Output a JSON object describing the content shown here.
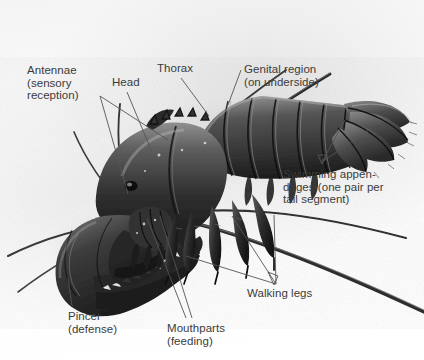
{
  "figure": {
    "background_color": "#ffffff",
    "label_color": "#3b3b3b",
    "leader_color": "#555555",
    "width": 424,
    "height": 360
  },
  "labels": [
    {
      "id": "antennae",
      "name": "label-antennae",
      "lines": [
        "Antennae",
        "(sensory",
        "reception)"
      ],
      "text": "Antennae (sensory reception)",
      "x": 27,
      "y": 64
    },
    {
      "id": "head",
      "name": "label-head",
      "lines": [
        "Head"
      ],
      "text": "Head",
      "x": 112,
      "y": 76
    },
    {
      "id": "thorax",
      "name": "label-thorax",
      "lines": [
        "Thorax"
      ],
      "text": "Thorax",
      "x": 157,
      "y": 62
    },
    {
      "id": "genital-region",
      "name": "label-genital-region",
      "lines": [
        "Genital region",
        "(on underside)"
      ],
      "text": "Genital region (on underside)",
      "x": 244,
      "y": 63
    },
    {
      "id": "swimming-appendages",
      "name": "label-swimming-appendages",
      "lines": [
        "Swimming appen-",
        "dages (one pair per",
        "tail segment)"
      ],
      "text": "Swimming appendages (one pair per tail segment)",
      "x": 283,
      "y": 168
    },
    {
      "id": "walking-legs",
      "name": "label-walking-legs",
      "lines": [
        "Walking legs"
      ],
      "text": "Walking legs",
      "x": 247,
      "y": 287
    },
    {
      "id": "pincer",
      "name": "label-pincer",
      "lines": [
        "Pincer",
        "(defense)"
      ],
      "text": "Pincer (defense)",
      "x": 68,
      "y": 310
    },
    {
      "id": "mouthparts",
      "name": "label-mouthparts",
      "lines": [
        "Mouthparts",
        "(feeding)"
      ],
      "text": "Mouthparts (feeding)",
      "x": 167,
      "y": 322
    }
  ],
  "leader_lines": [
    {
      "id": "antennae-1",
      "name": "leader-antennae-upper",
      "from": [
        100,
        96
      ],
      "to": [
        168,
        140
      ]
    },
    {
      "id": "antennae-2",
      "name": "leader-antennae-lower",
      "from": [
        100,
        96
      ],
      "to": [
        128,
        194
      ]
    },
    {
      "id": "head",
      "name": "leader-head",
      "from": [
        127,
        92
      ],
      "to": [
        152,
        152
      ]
    },
    {
      "id": "thorax",
      "name": "leader-thorax",
      "from": [
        181,
        78
      ],
      "to": [
        209,
        116
      ]
    },
    {
      "id": "genital",
      "name": "leader-genital-region",
      "from": [
        241,
        70
      ],
      "to": [
        228,
        105
      ]
    },
    {
      "id": "swim-1",
      "name": "leader-swimming-appendages-a",
      "from": [
        322,
        162
      ],
      "to": [
        345,
        120
      ]
    },
    {
      "id": "swim-2",
      "name": "leader-swimming-appendages-b",
      "from": [
        322,
        162
      ],
      "to": [
        372,
        128
      ]
    },
    {
      "id": "walk-1",
      "name": "leader-walking-legs-a",
      "from": [
        276,
        284
      ],
      "to": [
        186,
        256
      ]
    },
    {
      "id": "walk-2",
      "name": "leader-walking-legs-b",
      "from": [
        276,
        284
      ],
      "to": [
        232,
        216
      ]
    },
    {
      "id": "walk-3",
      "name": "leader-walking-legs-c",
      "from": [
        276,
        284
      ],
      "to": [
        274,
        215
      ]
    },
    {
      "id": "pincer",
      "name": "leader-pincer",
      "from": [
        72,
        306
      ],
      "to": [
        68,
        278
      ]
    },
    {
      "id": "mouth-1",
      "name": "leader-mouthparts-a",
      "from": [
        186,
        318
      ],
      "to": [
        147,
        218
      ]
    },
    {
      "id": "mouth-2",
      "name": "leader-mouthparts-b",
      "from": [
        192,
        318
      ],
      "to": [
        160,
        216
      ]
    }
  ]
}
